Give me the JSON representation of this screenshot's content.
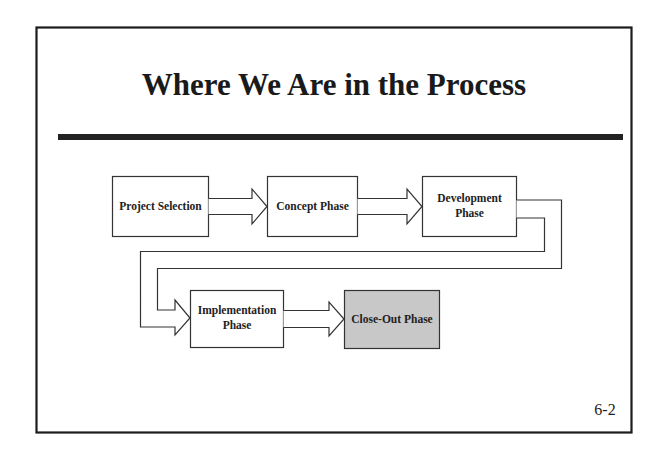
{
  "slide": {
    "title": "Where We Are in the Process",
    "page_number": "6-2"
  },
  "colors": {
    "border": "#1c1c1c",
    "rule": "#222222",
    "box_stroke": "#333333",
    "box_fill": "#ffffff",
    "highlight_fill": "#c8c8c8",
    "text": "#222222"
  },
  "diagram": {
    "nodes": [
      {
        "id": "project-selection",
        "lines": [
          "Project Selection"
        ],
        "highlighted": false
      },
      {
        "id": "concept-phase",
        "lines": [
          "Concept Phase"
        ],
        "highlighted": false
      },
      {
        "id": "development-phase",
        "lines": [
          "Development",
          "Phase"
        ],
        "highlighted": false
      },
      {
        "id": "implementation-phase",
        "lines": [
          "Implementation",
          "Phase"
        ],
        "highlighted": false
      },
      {
        "id": "close-out-phase",
        "lines": [
          "Close-Out Phase"
        ],
        "highlighted": true
      }
    ],
    "edges": [
      {
        "from": "project-selection",
        "to": "concept-phase"
      },
      {
        "from": "concept-phase",
        "to": "development-phase"
      },
      {
        "from": "development-phase",
        "to": "implementation-phase"
      },
      {
        "from": "implementation-phase",
        "to": "close-out-phase"
      }
    ],
    "current_phase": "Close-Out Phase"
  }
}
